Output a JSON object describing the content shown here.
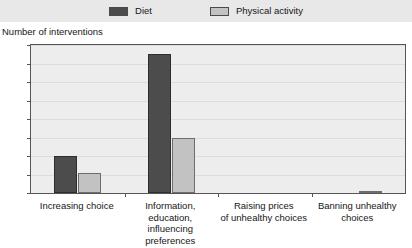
{
  "legend": {
    "position": "top",
    "entries": [
      {
        "label": "Diet",
        "color": "#4c4c4c",
        "swatch_name": "legend-swatch-diet"
      },
      {
        "label": "Physical activity",
        "color": "#c2c2c2",
        "swatch_name": "legend-swatch-physical-activity"
      }
    ]
  },
  "axes": {
    "ylabel": "Number of interventions",
    "xlabel": "",
    "yticks": [
      "80",
      "70",
      "60",
      "50",
      "40",
      "30",
      "20",
      "10",
      "0"
    ],
    "ylim": [
      0,
      80
    ],
    "grid": true
  },
  "chart_data": {
    "type": "bar",
    "title": "",
    "subtitle": "",
    "xlabel": "",
    "ylabel": "Number of interventions",
    "ylim": [
      0,
      80
    ],
    "ytick_values": [
      0,
      10,
      20,
      30,
      40,
      50,
      60,
      70,
      80
    ],
    "grid": true,
    "legend_position": "top",
    "categories": [
      "Increasing choice",
      "Information, education, influencing preferences",
      "Raising prices of unhealthy choices",
      "Banning unhealthy choices"
    ],
    "category_lines": [
      [
        "Increasing choice"
      ],
      [
        "Information, education,",
        "influencing preferences"
      ],
      [
        "Raising prices",
        "of unhealthy choices"
      ],
      [
        "Banning unhealthy",
        "choices"
      ]
    ],
    "series": [
      {
        "name": "Diet",
        "color": "#4c4c4c",
        "values": [
          20,
          75,
          0,
          0
        ]
      },
      {
        "name": "Physical activity",
        "color": "#c2c2c2",
        "values": [
          11,
          30,
          0,
          1
        ]
      }
    ]
  }
}
